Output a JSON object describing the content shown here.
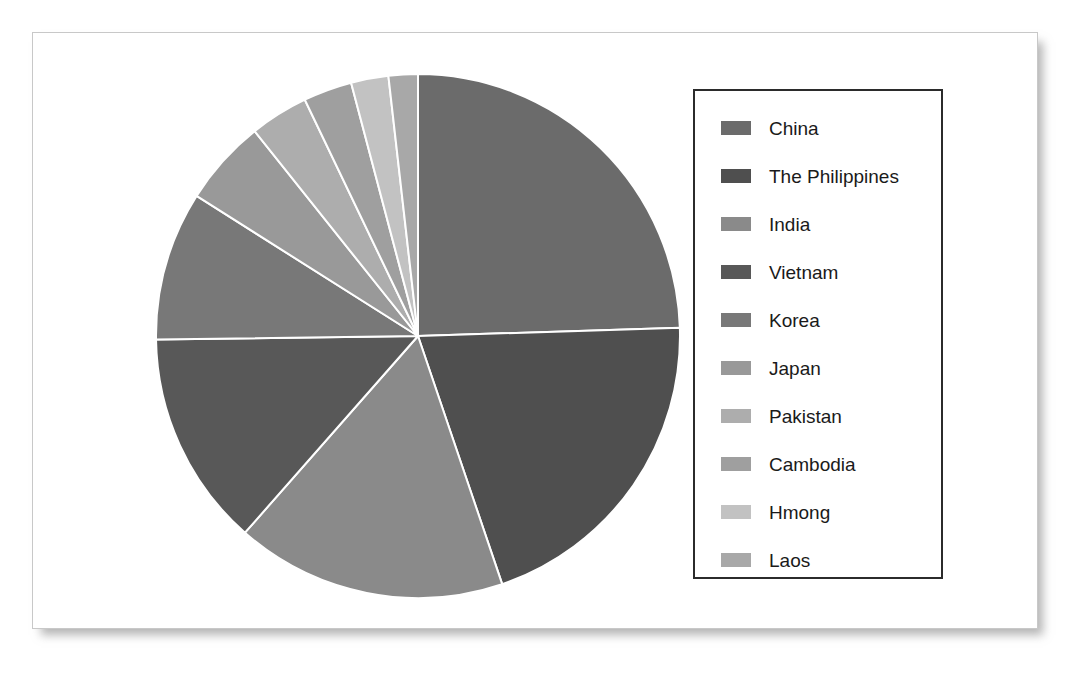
{
  "figure": {
    "background_color": "#ffffff",
    "frame_border_color": "#c8c8c8"
  },
  "legend": {
    "border_color": "#2b2b2b",
    "position": "right",
    "items": [
      {
        "label": "China",
        "color": "#6b6b6b"
      },
      {
        "label": "The Philippines",
        "color": "#4f4f4f"
      },
      {
        "label": "India",
        "color": "#8a8a8a"
      },
      {
        "label": "Vietnam",
        "color": "#585858"
      },
      {
        "label": "Korea",
        "color": "#787878"
      },
      {
        "label": "Japan",
        "color": "#999999"
      },
      {
        "label": "Pakistan",
        "color": "#adadad"
      },
      {
        "label": "Cambodia",
        "color": "#9f9f9f"
      },
      {
        "label": "Hmong",
        "color": "#c2c2c2"
      },
      {
        "label": "Laos",
        "color": "#a8a8a8"
      }
    ]
  },
  "chart_data": {
    "type": "pie",
    "title": "",
    "subtitle": "",
    "xlabel": "",
    "ylabel": "",
    "grid": false,
    "legend_position": "right",
    "start_angle_deg": 90,
    "direction": "clockwise",
    "wedge_edge_color": "#ffffff",
    "wedge_edge_width": 2,
    "center": {
      "x": 294,
      "y": 303
    },
    "radius": 262,
    "labels": [
      "China",
      "The Philippines",
      "India",
      "Vietnam",
      "Korea",
      "Japan",
      "Pakistan",
      "Cambodia",
      "Hmong",
      "Laos"
    ],
    "values": [
      24.5,
      20.3,
      16.7,
      13.3,
      9.2,
      5.3,
      3.6,
      3.0,
      2.3,
      1.8
    ],
    "unit": "percent",
    "colors": [
      "#6b6b6b",
      "#4f4f4f",
      "#8a8a8a",
      "#585858",
      "#787878",
      "#999999",
      "#adadad",
      "#9f9f9f",
      "#c2c2c2",
      "#a8a8a8"
    ],
    "slices": [
      {
        "label": "China",
        "value": 24.5,
        "angle_deg": 88.2,
        "color": "#6b6b6b"
      },
      {
        "label": "The Philippines",
        "value": 20.3,
        "angle_deg": 73.1,
        "color": "#4f4f4f"
      },
      {
        "label": "India",
        "value": 16.7,
        "angle_deg": 60.1,
        "color": "#8a8a8a"
      },
      {
        "label": "Vietnam",
        "value": 13.3,
        "angle_deg": 47.9,
        "color": "#585858"
      },
      {
        "label": "Korea",
        "value": 9.2,
        "angle_deg": 33.1,
        "color": "#787878"
      },
      {
        "label": "Japan",
        "value": 5.3,
        "angle_deg": 19.1,
        "color": "#999999"
      },
      {
        "label": "Pakistan",
        "value": 3.6,
        "angle_deg": 13.0,
        "color": "#adadad"
      },
      {
        "label": "Cambodia",
        "value": 3.0,
        "angle_deg": 10.8,
        "color": "#9f9f9f"
      },
      {
        "label": "Hmong",
        "value": 2.3,
        "angle_deg": 8.3,
        "color": "#c2c2c2"
      },
      {
        "label": "Laos",
        "value": 1.8,
        "angle_deg": 6.5,
        "color": "#a8a8a8"
      }
    ]
  }
}
